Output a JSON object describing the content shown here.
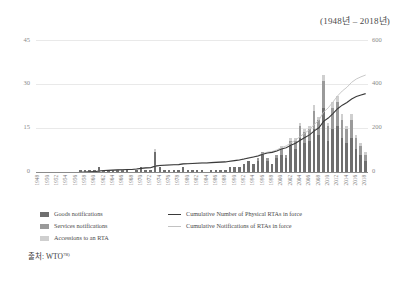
{
  "subtitle": "(1948년 – 2018년)",
  "source": {
    "prefix": "출처:",
    "name": "WTO",
    "note": "78)"
  },
  "legend": {
    "goods": "Goods notifications",
    "services": "Services notifications",
    "accessions": "Accessions to an RTA",
    "cum_physical": "Cumulative Number of Physical RTAs in force",
    "cum_notifications": "Cumulative Notifications of RTAs in force"
  },
  "colors": {
    "goods": "#6f6f6f",
    "services": "#9a9a9a",
    "accessions": "#cfcfcf",
    "cum_physical_line": "#3a3a3a",
    "cum_notifications_line": "#c2c2c2",
    "grid": "#e9e9e9",
    "axis": "#8b8b8b"
  },
  "chart_data": {
    "type": "bar",
    "title": "",
    "subtitle": "(1948년 – 2018년)",
    "xlabel": "",
    "ylabel": "",
    "y2label": "",
    "ylim": [
      0,
      45
    ],
    "y2lim": [
      0,
      600
    ],
    "yticks": [
      0,
      15,
      30,
      45
    ],
    "y2ticks": [
      0,
      200,
      400,
      600
    ],
    "grid": true,
    "legend_position": "bottom",
    "xtick_step": 2,
    "x": [
      1948,
      1949,
      1950,
      1951,
      1952,
      1953,
      1954,
      1955,
      1956,
      1957,
      1958,
      1959,
      1960,
      1961,
      1962,
      1963,
      1964,
      1965,
      1966,
      1967,
      1968,
      1969,
      1970,
      1971,
      1972,
      1973,
      1974,
      1975,
      1976,
      1977,
      1978,
      1979,
      1980,
      1981,
      1982,
      1983,
      1984,
      1985,
      1986,
      1987,
      1988,
      1989,
      1990,
      1991,
      1992,
      1993,
      1994,
      1995,
      1996,
      1997,
      1998,
      1999,
      2000,
      2001,
      2002,
      2003,
      2004,
      2005,
      2006,
      2007,
      2008,
      2009,
      2010,
      2011,
      2012,
      2013,
      2014,
      2015,
      2016,
      2017,
      2018
    ],
    "xticklabels": [
      "1948",
      "1950",
      "1952",
      "1954",
      "1956",
      "1958",
      "1960",
      "1962",
      "1964",
      "1966",
      "1968",
      "1970",
      "1972",
      "1974",
      "1976",
      "1978",
      "1980",
      "1982",
      "1984",
      "1986",
      "1988",
      "1990",
      "1992",
      "1994",
      "1996",
      "1998",
      "2000",
      "2002",
      "2004",
      "2006",
      "2008",
      "2010",
      "2012",
      "2014",
      "2016",
      "2018"
    ],
    "series": [
      {
        "name": "Goods notifications",
        "type": "bar",
        "axis": "left",
        "color": "#6f6f6f",
        "values": [
          0,
          0,
          0,
          0,
          0,
          0,
          0,
          0,
          0,
          1,
          1,
          1,
          1,
          2,
          1,
          1,
          1,
          1,
          1,
          1,
          0,
          1,
          2,
          1,
          1,
          7,
          2,
          1,
          1,
          1,
          1,
          2,
          1,
          1,
          1,
          1,
          0,
          1,
          1,
          1,
          1,
          2,
          2,
          2,
          3,
          4,
          3,
          4,
          6,
          4,
          3,
          5,
          6,
          5,
          9,
          8,
          12,
          10,
          11,
          15,
          13,
          22,
          11,
          15,
          16,
          12,
          10,
          12,
          8,
          6,
          4
        ]
      },
      {
        "name": "Services notifications",
        "type": "bar",
        "axis": "left",
        "color": "#9a9a9a",
        "values": [
          0,
          0,
          0,
          0,
          0,
          0,
          0,
          0,
          0,
          0,
          0,
          0,
          0,
          0,
          0,
          0,
          0,
          0,
          0,
          0,
          0,
          0,
          0,
          0,
          0,
          0,
          0,
          0,
          0,
          0,
          0,
          0,
          0,
          0,
          0,
          0,
          0,
          0,
          0,
          0,
          0,
          0,
          0,
          0,
          0,
          0,
          0,
          1,
          1,
          1,
          0,
          1,
          2,
          1,
          2,
          3,
          4,
          4,
          4,
          6,
          5,
          9,
          5,
          7,
          8,
          6,
          5,
          6,
          4,
          3,
          2
        ]
      },
      {
        "name": "Accessions to an RTA",
        "type": "bar",
        "axis": "left",
        "color": "#cfcfcf",
        "values": [
          0,
          0,
          0,
          0,
          0,
          0,
          0,
          0,
          0,
          0,
          0,
          0,
          0,
          0,
          0,
          0,
          0,
          0,
          0,
          0,
          0,
          0,
          0,
          0,
          0,
          1,
          0,
          0,
          0,
          0,
          0,
          0,
          0,
          0,
          0,
          0,
          0,
          0,
          0,
          0,
          0,
          0,
          0,
          0,
          0,
          0,
          0,
          0,
          0,
          0,
          0,
          0,
          1,
          0,
          1,
          1,
          1,
          1,
          1,
          2,
          1,
          2,
          1,
          2,
          2,
          2,
          1,
          2,
          1,
          1,
          1
        ]
      },
      {
        "name": "Cumulative Number of Physical RTAs in force",
        "type": "line",
        "axis": "right",
        "color": "#3a3a3a",
        "values": [
          1,
          1,
          1,
          1,
          1,
          1,
          1,
          1,
          1,
          3,
          4,
          5,
          6,
          9,
          11,
          12,
          13,
          14,
          15,
          16,
          16,
          18,
          21,
          23,
          24,
          31,
          34,
          35,
          36,
          37,
          38,
          41,
          42,
          43,
          44,
          45,
          45,
          47,
          48,
          49,
          50,
          53,
          56,
          59,
          63,
          68,
          72,
          77,
          85,
          90,
          93,
          99,
          108,
          114,
          125,
          134,
          148,
          160,
          172,
          190,
          204,
          233,
          248,
          268,
          290,
          306,
          318,
          334,
          345,
          352,
          358
        ]
      },
      {
        "name": "Cumulative Notifications of RTAs in force",
        "type": "line",
        "axis": "right",
        "color": "#c2c2c2",
        "values": [
          1,
          1,
          1,
          1,
          1,
          1,
          1,
          1,
          1,
          3,
          4,
          5,
          6,
          9,
          11,
          12,
          13,
          14,
          15,
          16,
          16,
          18,
          21,
          23,
          24,
          32,
          35,
          36,
          37,
          38,
          39,
          42,
          43,
          44,
          45,
          46,
          46,
          48,
          49,
          50,
          51,
          54,
          57,
          60,
          64,
          69,
          73,
          79,
          88,
          94,
          97,
          104,
          115,
          122,
          136,
          148,
          165,
          180,
          196,
          219,
          238,
          275,
          294,
          320,
          348,
          370,
          387,
          409,
          424,
          434,
          442
        ]
      }
    ]
  }
}
